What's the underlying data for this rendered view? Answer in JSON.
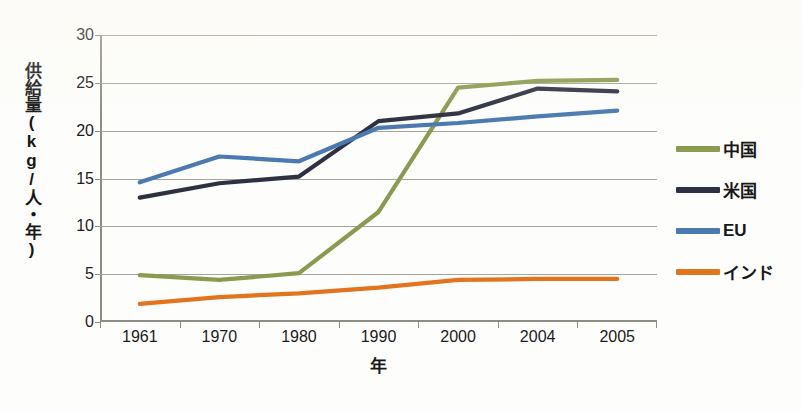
{
  "chart_data": {
    "type": "line",
    "title": "",
    "xlabel": "年",
    "ylabel": "供給量(kg/人・年)",
    "categories": [
      "1961",
      "1970",
      "1980",
      "1990",
      "2000",
      "2004",
      "2005"
    ],
    "ylim": [
      0,
      30
    ],
    "yticks": [
      0,
      5,
      10,
      15,
      20,
      25,
      30
    ],
    "grid": true,
    "legend_position": "right",
    "series": [
      {
        "name": "中国",
        "color": "#8a9a4f",
        "values": [
          4.9,
          4.4,
          5.1,
          11.5,
          24.5,
          25.2,
          25.3
        ]
      },
      {
        "name": "米国",
        "color": "#2e3142",
        "values": [
          13.0,
          14.5,
          15.2,
          21.0,
          21.8,
          24.4,
          24.1
        ]
      },
      {
        "name": "EU",
        "color": "#4a7ab0",
        "values": [
          14.6,
          17.3,
          16.8,
          20.3,
          20.8,
          21.5,
          22.1
        ]
      },
      {
        "name": "インド",
        "color": "#e2741e",
        "values": [
          1.9,
          2.6,
          3.0,
          3.6,
          4.4,
          4.5,
          4.5
        ]
      }
    ]
  },
  "axes": {
    "y_title": "供給量(kg/人・年)",
    "x_title": "年"
  },
  "colors": {
    "grid": "#a5a59c",
    "axis": "#8d8d84",
    "text": "#1b1b1b",
    "background": "#fdfdfb"
  }
}
